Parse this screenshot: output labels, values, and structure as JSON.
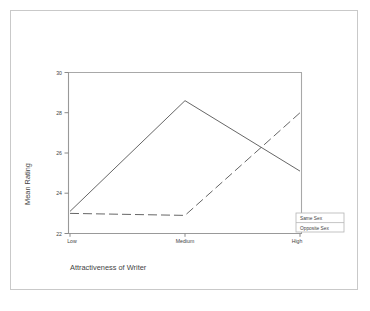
{
  "chart_data": {
    "type": "line",
    "title": "",
    "xlabel": "Attractiveness of Writer",
    "ylabel": "Mean Rating",
    "categories": [
      "Low",
      "Medium",
      "High"
    ],
    "ylim": [
      22,
      30
    ],
    "yticks": [
      22,
      24,
      26,
      28,
      30
    ],
    "ytick_labels": [
      "22",
      "24",
      "26",
      "28",
      "30"
    ],
    "grid": false,
    "legend_position": "lower-right",
    "series": [
      {
        "name": "Same Sex",
        "style": "solid",
        "values": [
          23.1,
          28.6,
          25.1
        ]
      },
      {
        "name": "Opposite Sex",
        "style": "dashed",
        "values": [
          23.0,
          22.9,
          28.0
        ]
      }
    ]
  },
  "axes": {
    "y_title": "Mean Rating",
    "x_title": "Attractiveness of Writer",
    "y_ticks": {
      "t0": "22",
      "t1": "24",
      "t2": "26",
      "t3": "28",
      "t4": "30"
    },
    "x_ticks": {
      "c0": "Low",
      "c1": "Medium",
      "c2": "High"
    }
  },
  "legend": {
    "entries": [
      {
        "label": "Same Sex"
      },
      {
        "label": "Opposite Sex"
      }
    ]
  }
}
